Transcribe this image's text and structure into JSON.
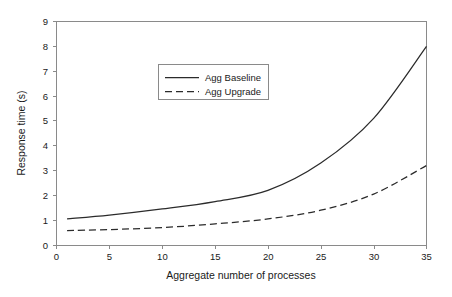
{
  "figure": {
    "background_color": "#ffffff",
    "frame_color": "#8a8a8a",
    "line_color": "#2b2b2b"
  },
  "chart_data": {
    "type": "line",
    "title": "",
    "xlabel": "Aggregate number of processes",
    "ylabel": "Response time (s)",
    "xlim": [
      0,
      35
    ],
    "ylim": [
      0,
      9
    ],
    "xticks": [
      0,
      5,
      10,
      15,
      20,
      25,
      30,
      35
    ],
    "yticks": [
      0,
      1,
      2,
      3,
      4,
      5,
      6,
      7,
      8,
      9
    ],
    "xtick_labels": [
      "0",
      "5",
      "10",
      "15",
      "20",
      "25",
      "30",
      "35"
    ],
    "ytick_labels": [
      "0",
      "1",
      "2",
      "3",
      "4",
      "5",
      "6",
      "7",
      "8",
      "9"
    ],
    "grid": false,
    "legend_position": "upper-left-inset",
    "x": [
      1,
      5,
      10,
      15,
      20,
      25,
      30,
      35
    ],
    "series": [
      {
        "name": "Agg Baseline",
        "style": "solid",
        "color": "#2b2b2b",
        "values": [
          1.05,
          1.2,
          1.45,
          1.75,
          2.2,
          3.3,
          5.1,
          8.0
        ]
      },
      {
        "name": "Agg Upgrade",
        "style": "dashed",
        "color": "#2b2b2b",
        "values": [
          0.58,
          0.62,
          0.7,
          0.85,
          1.05,
          1.4,
          2.05,
          3.2
        ]
      }
    ]
  },
  "legend": {
    "entries": [
      {
        "label": "Agg Baseline",
        "style": "solid"
      },
      {
        "label": "Agg Upgrade",
        "style": "dashed"
      }
    ]
  }
}
